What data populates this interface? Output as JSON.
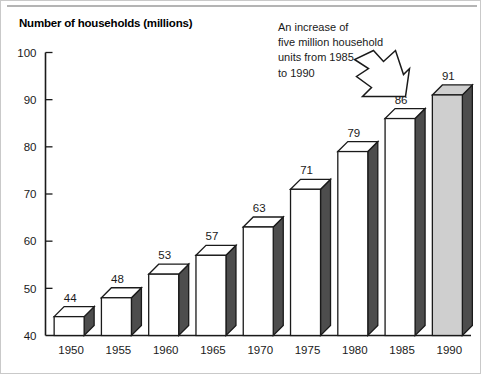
{
  "chart_data": {
    "type": "bar",
    "title": "Number of households (millions)",
    "xlabel": "",
    "ylabel": "",
    "categories": [
      "1950",
      "1955",
      "1960",
      "1965",
      "1970",
      "1975",
      "1980",
      "1985",
      "1990"
    ],
    "values": [
      44,
      48,
      53,
      57,
      63,
      71,
      79,
      86,
      91
    ],
    "value_labels": [
      "44",
      "48",
      "53",
      "57",
      "63",
      "71",
      "79",
      "86",
      "91"
    ],
    "ylim": [
      40,
      100
    ],
    "yticks": [
      40,
      50,
      60,
      70,
      80,
      90,
      100
    ],
    "ytick_labels": [
      "40",
      "50",
      "60",
      "70",
      "80",
      "90",
      "100"
    ],
    "xtick_labels": [
      "1950",
      "1955",
      "1960",
      "1965",
      "1970",
      "1975",
      "1980",
      "1985",
      "1990"
    ],
    "grid": false,
    "legend": null,
    "highlighted_category": "1990",
    "annotations": [
      {
        "text_lines": [
          "An increase of",
          "five million household",
          "units from 1985",
          "to 1990"
        ],
        "arrow": "zigzag-arrow-down-right",
        "points_to": "1990"
      }
    ],
    "style": {
      "bar_face_color": "#ffffff",
      "bar_highlight_face_color": "#cfcfcf",
      "bar_side_color": "#4d4d4d",
      "bar_outline_color": "#1a1a1a",
      "axis_color": "#1a1a1a",
      "text_color": "#1a1a1a",
      "top_rule_color": "#b4b4b4",
      "background_color": "#ffffff"
    }
  },
  "annotation": {
    "line1": "An increase of",
    "line2": "five million household",
    "line3": "units from 1985",
    "line4": "to 1990"
  }
}
